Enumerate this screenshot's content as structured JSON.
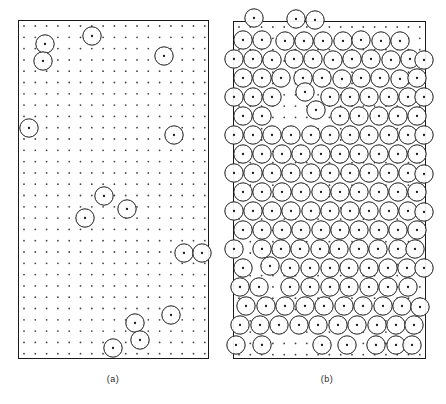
{
  "figure": {
    "background_color": "#ffffff",
    "line_color": "#1a1a1a",
    "dot_color": "#444444",
    "width": 446,
    "height": 404
  },
  "panels": [
    {
      "id": "panel-a",
      "caption": "(a)",
      "caption_x": 113,
      "caption_y": 374,
      "frame": {
        "x": 18,
        "y": 20,
        "width": 190,
        "height": 338
      },
      "lattice": {
        "type": "square",
        "spacing": 11.3,
        "origin_x": 24,
        "origin_y": 26,
        "cols": 17,
        "rows": 30,
        "dot_radius": 0.9
      },
      "circle_radius": 9.2,
      "circle_count": 13,
      "circles": [
        {
          "cx": 45,
          "cy": 44
        },
        {
          "cx": 43,
          "cy": 61
        },
        {
          "cx": 92,
          "cy": 36
        },
        {
          "cx": 164,
          "cy": 56
        },
        {
          "cx": 29,
          "cy": 128
        },
        {
          "cx": 174,
          "cy": 135
        },
        {
          "cx": 104,
          "cy": 196
        },
        {
          "cx": 127,
          "cy": 209
        },
        {
          "cx": 85,
          "cy": 218
        },
        {
          "cx": 184,
          "cy": 253
        },
        {
          "cx": 202,
          "cy": 253
        },
        {
          "cx": 171,
          "cy": 315
        },
        {
          "cx": 135,
          "cy": 323
        },
        {
          "cx": 140,
          "cy": 340
        },
        {
          "cx": 113,
          "cy": 348
        }
      ]
    },
    {
      "id": "panel-b",
      "caption": "(b)",
      "caption_x": 327,
      "caption_y": 374,
      "frame": {
        "x": 233,
        "y": 21,
        "width": 192,
        "height": 337
      },
      "lattice": {
        "type": "square",
        "spacing": 11.3,
        "origin_x": 239,
        "origin_y": 27,
        "cols": 17,
        "rows": 30,
        "dot_radius": 0.9
      },
      "circle_radius": 9.2,
      "circle_count": 152,
      "circles": [
        {
          "cx": 254,
          "cy": 18
        },
        {
          "cx": 296,
          "cy": 19
        },
        {
          "cx": 315,
          "cy": 20
        },
        {
          "cx": 243,
          "cy": 40
        },
        {
          "cx": 262,
          "cy": 40
        },
        {
          "cx": 285,
          "cy": 41
        },
        {
          "cx": 304,
          "cy": 41
        },
        {
          "cx": 323,
          "cy": 41
        },
        {
          "cx": 343,
          "cy": 41
        },
        {
          "cx": 361,
          "cy": 40
        },
        {
          "cx": 381,
          "cy": 41
        },
        {
          "cx": 400,
          "cy": 41
        },
        {
          "cx": 234,
          "cy": 59
        },
        {
          "cx": 253,
          "cy": 59
        },
        {
          "cx": 272,
          "cy": 60
        },
        {
          "cx": 294,
          "cy": 59
        },
        {
          "cx": 313,
          "cy": 59
        },
        {
          "cx": 333,
          "cy": 60
        },
        {
          "cx": 352,
          "cy": 59
        },
        {
          "cx": 371,
          "cy": 59
        },
        {
          "cx": 391,
          "cy": 60
        },
        {
          "cx": 410,
          "cy": 59
        },
        {
          "cx": 424,
          "cy": 60
        },
        {
          "cx": 243,
          "cy": 78
        },
        {
          "cx": 262,
          "cy": 78
        },
        {
          "cx": 281,
          "cy": 78
        },
        {
          "cx": 303,
          "cy": 78
        },
        {
          "cx": 322,
          "cy": 78
        },
        {
          "cx": 342,
          "cy": 79
        },
        {
          "cx": 361,
          "cy": 78
        },
        {
          "cx": 380,
          "cy": 78
        },
        {
          "cx": 400,
          "cy": 79
        },
        {
          "cx": 417,
          "cy": 78
        },
        {
          "cx": 234,
          "cy": 97
        },
        {
          "cx": 253,
          "cy": 97
        },
        {
          "cx": 272,
          "cy": 97
        },
        {
          "cx": 305,
          "cy": 92
        },
        {
          "cx": 330,
          "cy": 97
        },
        {
          "cx": 350,
          "cy": 97
        },
        {
          "cx": 369,
          "cy": 97
        },
        {
          "cx": 389,
          "cy": 97
        },
        {
          "cx": 408,
          "cy": 97
        },
        {
          "cx": 424,
          "cy": 97
        },
        {
          "cx": 243,
          "cy": 116
        },
        {
          "cx": 262,
          "cy": 116
        },
        {
          "cx": 316,
          "cy": 110
        },
        {
          "cx": 340,
          "cy": 116
        },
        {
          "cx": 359,
          "cy": 116
        },
        {
          "cx": 379,
          "cy": 116
        },
        {
          "cx": 398,
          "cy": 116
        },
        {
          "cx": 417,
          "cy": 116
        },
        {
          "cx": 234,
          "cy": 135
        },
        {
          "cx": 253,
          "cy": 135
        },
        {
          "cx": 272,
          "cy": 135
        },
        {
          "cx": 291,
          "cy": 135
        },
        {
          "cx": 311,
          "cy": 135
        },
        {
          "cx": 330,
          "cy": 135
        },
        {
          "cx": 350,
          "cy": 135
        },
        {
          "cx": 369,
          "cy": 135
        },
        {
          "cx": 389,
          "cy": 135
        },
        {
          "cx": 408,
          "cy": 135
        },
        {
          "cx": 424,
          "cy": 135
        },
        {
          "cx": 243,
          "cy": 154
        },
        {
          "cx": 262,
          "cy": 154
        },
        {
          "cx": 282,
          "cy": 154
        },
        {
          "cx": 301,
          "cy": 154
        },
        {
          "cx": 321,
          "cy": 154
        },
        {
          "cx": 340,
          "cy": 154
        },
        {
          "cx": 359,
          "cy": 154
        },
        {
          "cx": 379,
          "cy": 154
        },
        {
          "cx": 398,
          "cy": 154
        },
        {
          "cx": 417,
          "cy": 154
        },
        {
          "cx": 234,
          "cy": 173
        },
        {
          "cx": 253,
          "cy": 173
        },
        {
          "cx": 272,
          "cy": 173
        },
        {
          "cx": 291,
          "cy": 173
        },
        {
          "cx": 311,
          "cy": 173
        },
        {
          "cx": 330,
          "cy": 173
        },
        {
          "cx": 350,
          "cy": 173
        },
        {
          "cx": 369,
          "cy": 173
        },
        {
          "cx": 389,
          "cy": 173
        },
        {
          "cx": 408,
          "cy": 173
        },
        {
          "cx": 424,
          "cy": 174
        },
        {
          "cx": 243,
          "cy": 192
        },
        {
          "cx": 262,
          "cy": 192
        },
        {
          "cx": 282,
          "cy": 192
        },
        {
          "cx": 301,
          "cy": 192
        },
        {
          "cx": 321,
          "cy": 192
        },
        {
          "cx": 340,
          "cy": 192
        },
        {
          "cx": 359,
          "cy": 192
        },
        {
          "cx": 379,
          "cy": 192
        },
        {
          "cx": 398,
          "cy": 192
        },
        {
          "cx": 417,
          "cy": 192
        },
        {
          "cx": 234,
          "cy": 211
        },
        {
          "cx": 253,
          "cy": 211
        },
        {
          "cx": 272,
          "cy": 211
        },
        {
          "cx": 291,
          "cy": 211
        },
        {
          "cx": 311,
          "cy": 211
        },
        {
          "cx": 330,
          "cy": 211
        },
        {
          "cx": 350,
          "cy": 211
        },
        {
          "cx": 369,
          "cy": 211
        },
        {
          "cx": 389,
          "cy": 211
        },
        {
          "cx": 408,
          "cy": 211
        },
        {
          "cx": 424,
          "cy": 212
        },
        {
          "cx": 243,
          "cy": 230
        },
        {
          "cx": 262,
          "cy": 230
        },
        {
          "cx": 282,
          "cy": 230
        },
        {
          "cx": 301,
          "cy": 230
        },
        {
          "cx": 321,
          "cy": 230
        },
        {
          "cx": 340,
          "cy": 230
        },
        {
          "cx": 359,
          "cy": 230
        },
        {
          "cx": 379,
          "cy": 230
        },
        {
          "cx": 398,
          "cy": 230
        },
        {
          "cx": 417,
          "cy": 230
        },
        {
          "cx": 234,
          "cy": 249
        },
        {
          "cx": 262,
          "cy": 249
        },
        {
          "cx": 281,
          "cy": 249
        },
        {
          "cx": 300,
          "cy": 249
        },
        {
          "cx": 320,
          "cy": 249
        },
        {
          "cx": 339,
          "cy": 249
        },
        {
          "cx": 359,
          "cy": 249
        },
        {
          "cx": 378,
          "cy": 249
        },
        {
          "cx": 398,
          "cy": 249
        },
        {
          "cx": 415,
          "cy": 249
        },
        {
          "cx": 243,
          "cy": 268
        },
        {
          "cx": 270,
          "cy": 266
        },
        {
          "cx": 290,
          "cy": 268
        },
        {
          "cx": 310,
          "cy": 268
        },
        {
          "cx": 330,
          "cy": 268
        },
        {
          "cx": 349,
          "cy": 268
        },
        {
          "cx": 369,
          "cy": 268
        },
        {
          "cx": 388,
          "cy": 268
        },
        {
          "cx": 407,
          "cy": 268
        },
        {
          "cx": 424,
          "cy": 268
        },
        {
          "cx": 240,
          "cy": 287
        },
        {
          "cx": 259,
          "cy": 287
        },
        {
          "cx": 290,
          "cy": 287
        },
        {
          "cx": 310,
          "cy": 287
        },
        {
          "cx": 330,
          "cy": 287
        },
        {
          "cx": 349,
          "cy": 287
        },
        {
          "cx": 369,
          "cy": 287
        },
        {
          "cx": 388,
          "cy": 287
        },
        {
          "cx": 408,
          "cy": 287
        },
        {
          "cx": 246,
          "cy": 306
        },
        {
          "cx": 266,
          "cy": 306
        },
        {
          "cx": 285,
          "cy": 306
        },
        {
          "cx": 305,
          "cy": 306
        },
        {
          "cx": 324,
          "cy": 306
        },
        {
          "cx": 344,
          "cy": 306
        },
        {
          "cx": 363,
          "cy": 306
        },
        {
          "cx": 383,
          "cy": 306
        },
        {
          "cx": 402,
          "cy": 306
        },
        {
          "cx": 420,
          "cy": 307
        },
        {
          "cx": 240,
          "cy": 325
        },
        {
          "cx": 260,
          "cy": 325
        },
        {
          "cx": 279,
          "cy": 325
        },
        {
          "cx": 299,
          "cy": 325
        },
        {
          "cx": 318,
          "cy": 325
        },
        {
          "cx": 338,
          "cy": 325
        },
        {
          "cx": 357,
          "cy": 325
        },
        {
          "cx": 377,
          "cy": 325
        },
        {
          "cx": 396,
          "cy": 325
        },
        {
          "cx": 414,
          "cy": 325
        },
        {
          "cx": 236,
          "cy": 345
        },
        {
          "cx": 262,
          "cy": 345
        },
        {
          "cx": 322,
          "cy": 345
        },
        {
          "cx": 347,
          "cy": 345
        },
        {
          "cx": 376,
          "cy": 345
        },
        {
          "cx": 396,
          "cy": 345
        },
        {
          "cx": 412,
          "cy": 345
        }
      ],
      "void_region": {
        "cx": 348,
        "cy": 182,
        "r": 12
      }
    }
  ]
}
